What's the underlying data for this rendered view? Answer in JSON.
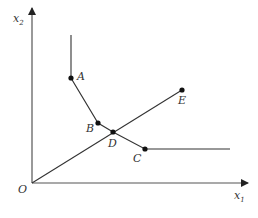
{
  "diagram": {
    "colors": {
      "line": "#333333",
      "axis": "#555555",
      "point": "#111111",
      "background": "#ffffff"
    },
    "axes": {
      "origin_label": "O",
      "x_label": "x",
      "x_sub": "1",
      "y_label": "x",
      "y_sub": "2"
    },
    "points": {
      "A": {
        "label": "A",
        "x": 71,
        "y": 78
      },
      "B": {
        "label": "B",
        "x": 98,
        "y": 123
      },
      "C": {
        "label": "C",
        "x": 145,
        "y": 149
      },
      "D": {
        "label": "D",
        "x": 113,
        "y": 132
      },
      "E": {
        "label": "E",
        "x": 182,
        "y": 90
      }
    }
  }
}
